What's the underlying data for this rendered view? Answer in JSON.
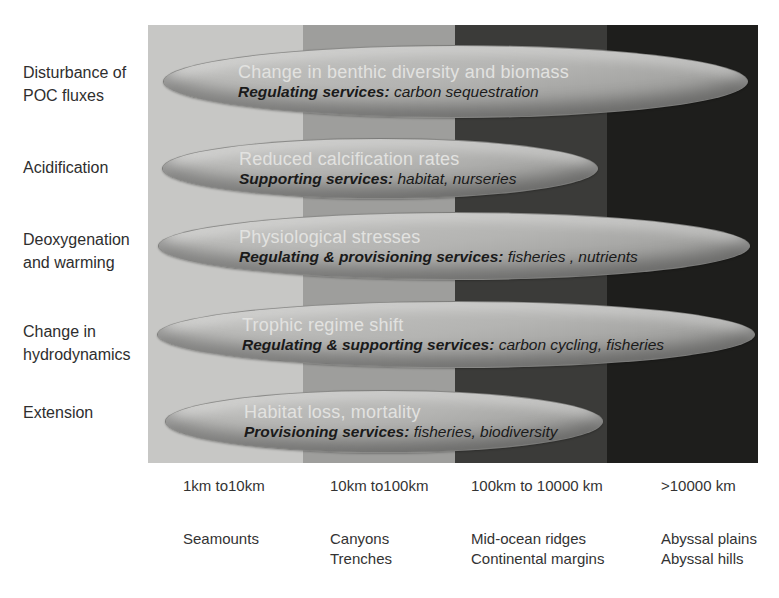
{
  "rows": [
    {
      "label_line1": "Disturbance of",
      "label_line2": "POC fluxes",
      "impact": "Change in benthic diversity and biomass",
      "service_category": "Regulating services:",
      "service_items": " carbon sequestration"
    },
    {
      "label_line1": "Acidification",
      "label_line2": "",
      "impact": "Reduced calcification rates",
      "service_category": "Supporting services:",
      "service_items": " habitat, nurseries"
    },
    {
      "label_line1": "Deoxygenation",
      "label_line2": "and warming",
      "impact": "Physiological stresses",
      "service_category": "Regulating & provisioning services:",
      "service_items": " fisheries , nutrients"
    },
    {
      "label_line1": "Change in",
      "label_line2": "hydrodynamics",
      "impact": "Trophic regime shift",
      "service_category": "Regulating & supporting services:",
      "service_items": " carbon cycling, fisheries"
    },
    {
      "label_line1": "Extension",
      "label_line2": "",
      "impact": "Habitat loss, mortality",
      "service_category": "Provisioning services:",
      "service_items": " fisheries, biodiversity"
    }
  ],
  "scale_axis": {
    "columns": [
      {
        "scale": "1km to10km",
        "feature_line1": "Seamounts",
        "feature_line2": ""
      },
      {
        "scale": "10km to100km",
        "feature_line1": "Canyons",
        "feature_line2": "Trenches"
      },
      {
        "scale": "100km to 10000 km",
        "feature_line1": "Mid-ocean ridges",
        "feature_line2": "Continental margins"
      },
      {
        "scale": ">10000 km",
        "feature_line1": "Abyssal plains",
        "feature_line2": "Abyssal hills"
      }
    ]
  },
  "colors": {
    "band_1": "#c7c7c5",
    "band_2": "#9e9e9c",
    "band_3": "#3b3b39",
    "band_4": "#1e1e1c",
    "ellipse_fill": "#b3b3b1",
    "impact_text": "#e2e2e0",
    "service_text": "#1a1a1a",
    "label_text": "#2e2e2e"
  }
}
